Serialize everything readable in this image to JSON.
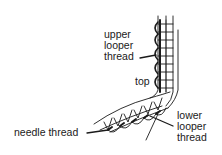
{
  "diagram": {
    "type": "stitch-illustration",
    "labels": {
      "upper_looper": [
        "upper",
        "looper",
        "thread"
      ],
      "top": "top",
      "needle": "needle thread",
      "lower_looper": [
        "lower",
        "looper",
        "thread"
      ]
    },
    "colors": {
      "ink": "#1a1a1a",
      "background": "#ffffff"
    }
  }
}
